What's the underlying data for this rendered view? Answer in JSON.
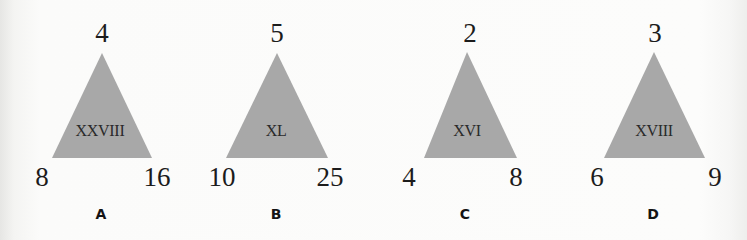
{
  "puzzle": {
    "triangle_color": "#a8a8a8",
    "items": [
      {
        "label": "A",
        "top": "4",
        "bottom_left": "8",
        "bottom_right": "16",
        "center": "XXVIII"
      },
      {
        "label": "B",
        "top": "5",
        "bottom_left": "10",
        "bottom_right": "25",
        "center": "XL"
      },
      {
        "label": "C",
        "top": "2",
        "bottom_left": "4",
        "bottom_right": "8",
        "center": "XVI"
      },
      {
        "label": "D",
        "top": "3",
        "bottom_left": "6",
        "bottom_right": "9",
        "center": "XVIII"
      }
    ]
  }
}
